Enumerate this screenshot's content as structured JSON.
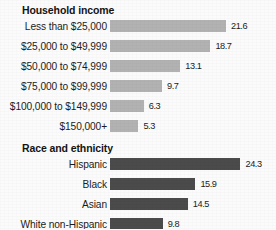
{
  "chart_data": {
    "type": "bar",
    "orientation": "horizontal",
    "title": "",
    "xlabel": "",
    "ylabel": "",
    "grid": false,
    "legend": false,
    "xlim": [
      0,
      26
    ],
    "colors": {
      "income_bar": "#b2b2b2",
      "race_bar": "#4b4b4b",
      "background": "#fbfbfb",
      "text": "#1c1c1c"
    },
    "groups": [
      {
        "title": "Household income",
        "bar_color": "#b2b2b2",
        "categories": [
          "Less than $25,000",
          "$25,000 to $49,999",
          "$50,000 to $74,999",
          "$75,000 to $99,999",
          "$100,000 to $149,999",
          "$150,000+"
        ],
        "values": [
          21.6,
          18.7,
          13.1,
          9.7,
          6.3,
          5.3
        ],
        "value_labels": [
          "21.6",
          "18.7",
          "13.1",
          "9.7",
          "6.3",
          "5.3"
        ]
      },
      {
        "title": "Race and ethnicity",
        "bar_color": "#4b4b4b",
        "categories": [
          "Hispanic",
          "Black",
          "Asian",
          "White non-Hispanic"
        ],
        "values": [
          24.3,
          15.9,
          14.5,
          9.8
        ],
        "value_labels": [
          "24.3",
          "15.9",
          "14.5",
          "9.8"
        ]
      }
    ]
  }
}
